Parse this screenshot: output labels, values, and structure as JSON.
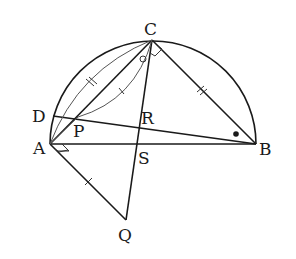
{
  "diagram": {
    "type": "geometry",
    "points": {
      "A": {
        "label": "A"
      },
      "B": {
        "label": "B"
      },
      "C": {
        "label": "C"
      },
      "D": {
        "label": "D"
      },
      "P": {
        "label": "P"
      },
      "Q": {
        "label": "Q"
      },
      "R": {
        "label": "R"
      },
      "S": {
        "label": "S"
      }
    },
    "segments": [
      "AB",
      "AC",
      "BC",
      "CQ",
      "AQ",
      "DB",
      "AP",
      "PC"
    ],
    "arcs": [
      "semicircle on AB",
      "arc AC (auxiliary)",
      "arc PC (auxiliary)"
    ],
    "marks": {
      "right_angle_at_A": "angle QAB",
      "right_angle_at_C": "angle ACB",
      "equal_single_tick": [
        "AQ",
        "arc PC"
      ],
      "equal_double_tick": [
        "arc AC",
        "BC"
      ],
      "circle_mark_angle": "angle at C (ACQ)",
      "dot_mark_angle": "angle at B (CBD)"
    },
    "colors": {
      "stroke": "#1a1a1a",
      "aux_stroke": "#555555",
      "background": "#ffffff"
    }
  }
}
